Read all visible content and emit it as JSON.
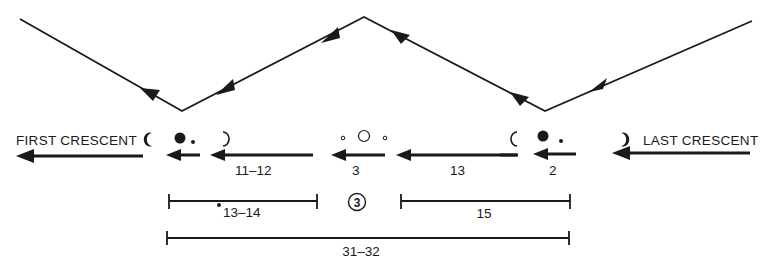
{
  "diagram": {
    "labels": {
      "first_crescent": "FIRST CRESCENT",
      "last_crescent": "LAST CRESCENT"
    },
    "segments": [
      {
        "id": "seg-2",
        "label": "2"
      },
      {
        "id": "seg-13",
        "label": "13"
      },
      {
        "id": "seg-3",
        "label": "3"
      },
      {
        "id": "seg-11-12",
        "label": "11–12"
      }
    ],
    "brackets": [
      {
        "id": "bracket-13-14",
        "label": "13–14"
      },
      {
        "id": "bracket-15",
        "label": "15"
      },
      {
        "id": "bracket-31-32",
        "label": "31–32"
      }
    ],
    "circled_marker": "3",
    "colors": {
      "ink": "#1a1a1a",
      "background": "#ffffff"
    }
  }
}
